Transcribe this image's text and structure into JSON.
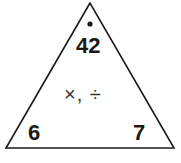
{
  "diagram": {
    "type": "fact-family-triangle",
    "top": "42",
    "bottom_left": "6",
    "bottom_right": "7",
    "operations": "×, ÷",
    "colors": {
      "stroke": "#1a1a1a",
      "background": "#ffffff"
    }
  }
}
